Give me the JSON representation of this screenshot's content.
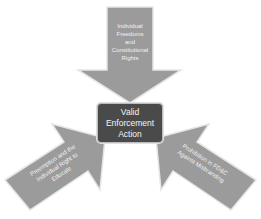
{
  "diagram": {
    "type": "converging-arrows",
    "center": {
      "label_lines": [
        "Valid",
        "Enforcement",
        "Action"
      ],
      "fill": "#4a4a4a",
      "text_color": "#f4f4f4"
    },
    "arrows": [
      {
        "position": "top",
        "direction": "down",
        "label_lines": [
          "Individual",
          "Freedoms",
          "and",
          "Constitutional",
          "Rights"
        ],
        "fill": "#9b9b9b"
      },
      {
        "position": "bottom-left",
        "direction": "up-right",
        "label_lines": [
          "Preemption and the",
          "Individual Right to",
          "Educate"
        ],
        "fill": "#9b9b9b"
      },
      {
        "position": "bottom-right",
        "direction": "up-left",
        "label_lines": [
          "Prohibition in FD&C",
          "Against Misbranding"
        ],
        "fill": "#9b9b9b"
      }
    ],
    "colors": {
      "arrow_fill": "#9b9b9b",
      "arrow_outline": "#e6e6e6",
      "background": "#ffffff"
    }
  }
}
